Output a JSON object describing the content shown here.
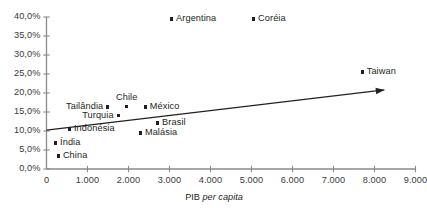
{
  "chart_data": {
    "type": "scatter",
    "title": "",
    "xlabel": "PIB per capita",
    "ylabel": "",
    "xlim": [
      0,
      9000
    ],
    "ylim": [
      0,
      0.4
    ],
    "grid": false,
    "legend": "none",
    "xticks": [
      "0",
      "1.000",
      "2.000",
      "3.000",
      "4.000",
      "5.000",
      "6.000",
      "7.000",
      "8.000",
      "9.000"
    ],
    "xtick_values": [
      0,
      1000,
      2000,
      3000,
      4000,
      5000,
      6000,
      7000,
      8000,
      9000
    ],
    "yticks": [
      "0,0%",
      "5,0%",
      "10,0%",
      "15,0%",
      "20,0%",
      "25,0%",
      "30,0%",
      "35,0%",
      "40,0%"
    ],
    "ytick_values": [
      0,
      5,
      10,
      15,
      20,
      25,
      30,
      35,
      40
    ],
    "points": [
      {
        "name": "Argentina",
        "x": 3050,
        "y": 39.5,
        "label_side": "right"
      },
      {
        "name": "Coréia",
        "x": 5050,
        "y": 39.5,
        "label_side": "right"
      },
      {
        "name": "Taiwan",
        "x": 7700,
        "y": 25.5,
        "label_side": "right"
      },
      {
        "name": "Chile",
        "x": 1950,
        "y": 16.5,
        "label_side": "above"
      },
      {
        "name": "Tailândia",
        "x": 1490,
        "y": 16.3,
        "label_side": "left"
      },
      {
        "name": "México",
        "x": 2410,
        "y": 16.3,
        "label_side": "right"
      },
      {
        "name": "Turquia",
        "x": 1760,
        "y": 14.0,
        "label_side": "left"
      },
      {
        "name": "Brasil",
        "x": 2710,
        "y": 12.1,
        "label_side": "right"
      },
      {
        "name": "Indonésia",
        "x": 560,
        "y": 10.5,
        "label_side": "right"
      },
      {
        "name": "Malásia",
        "x": 2290,
        "y": 9.5,
        "label_side": "right"
      },
      {
        "name": "Índia",
        "x": 220,
        "y": 6.8,
        "label_side": "right"
      },
      {
        "name": "China",
        "x": 290,
        "y": 3.4,
        "label_side": "right"
      }
    ],
    "trendline": {
      "type": "arrow",
      "x_start": 0,
      "y_start": 10.2,
      "x_end": 8240,
      "y_end": 20.8
    },
    "annotations": []
  },
  "axis": {
    "x_title_prefix": "PIB ",
    "x_title_italic": "per capita"
  }
}
